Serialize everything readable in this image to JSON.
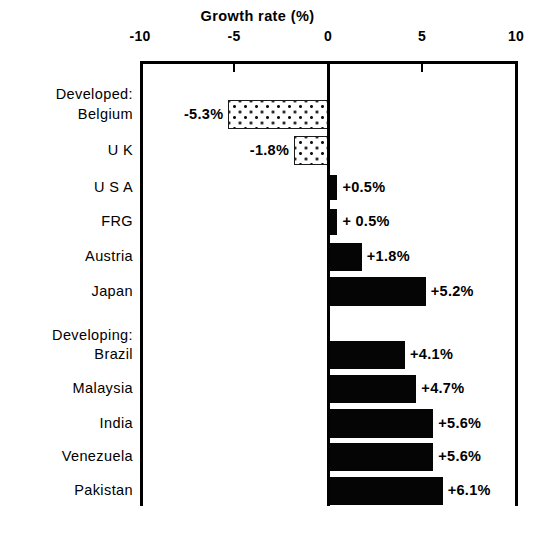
{
  "chart_data": {
    "type": "bar",
    "orientation": "horizontal",
    "title": "Growth rate (%)",
    "xlabel": "Growth rate (%)",
    "ylabel": "",
    "xlim": [
      -10,
      10
    ],
    "xticks": [
      -10,
      -5,
      0,
      5,
      10
    ],
    "xtick_labels": [
      "-10",
      "-5",
      "0",
      "5",
      "10"
    ],
    "grid": false,
    "legend": null,
    "zero_line": 0,
    "groups": [
      {
        "label": "Developed:",
        "key": "developed"
      },
      {
        "label": "Developing:",
        "key": "developing"
      }
    ],
    "categories": [
      "Belgium",
      "U K",
      "U S A",
      "FRG",
      "Austria",
      "Japan",
      "Brazil",
      "Malaysia",
      "India",
      "Venezuela",
      "Pakistan"
    ],
    "values": [
      -5.3,
      -1.8,
      0.5,
      0.5,
      1.8,
      5.2,
      4.1,
      4.7,
      5.6,
      5.6,
      6.1
    ],
    "data_labels": [
      "-5.3%",
      "-1.8%",
      "+0.5%",
      "+ 0.5%",
      "+1.8%",
      "+5.2%",
      "+4.1%",
      "+4.7%",
      "+5.6%",
      "+5.6%",
      "+6.1%"
    ],
    "series": [
      {
        "name": "Growth rate",
        "points": [
          {
            "group": "Developed:",
            "category": "Belgium",
            "value": -5.3,
            "label": "-5.3%",
            "fill": "dotted"
          },
          {
            "group": "Developed:",
            "category": "U K",
            "value": -1.8,
            "label": "-1.8%",
            "fill": "dotted"
          },
          {
            "group": "Developed:",
            "category": "U S A",
            "value": 0.5,
            "label": "+0.5%",
            "fill": "solid"
          },
          {
            "group": "Developed:",
            "category": "FRG",
            "value": 0.5,
            "label": "+ 0.5%",
            "fill": "solid"
          },
          {
            "group": "Developed:",
            "category": "Austria",
            "value": 1.8,
            "label": "+1.8%",
            "fill": "solid"
          },
          {
            "group": "Developed:",
            "category": "Japan",
            "value": 5.2,
            "label": "+5.2%",
            "fill": "solid"
          },
          {
            "group": "Developing:",
            "category": "Brazil",
            "value": 4.1,
            "label": "+4.1%",
            "fill": "solid"
          },
          {
            "group": "Developing:",
            "category": "Malaysia",
            "value": 4.7,
            "label": "+4.7%",
            "fill": "solid"
          },
          {
            "group": "Developing:",
            "category": "India",
            "value": 5.6,
            "label": "+5.6%",
            "fill": "solid"
          },
          {
            "group": "Developing:",
            "category": "Venezuela",
            "value": 5.6,
            "label": "+5.6%",
            "fill": "solid"
          },
          {
            "group": "Developing:",
            "category": "Pakistan",
            "value": 6.1,
            "label": "+6.1%",
            "fill": "solid"
          }
        ]
      }
    ],
    "colors": {
      "bar_positive": "#050505",
      "bar_negative_edge": "#1a1a1a",
      "bar_negative_fill": "#ffffff",
      "axis": "#000000",
      "text": "#000000",
      "background": "#ffffff"
    }
  },
  "title": {
    "text": "Growth rate (%)"
  },
  "axis": {
    "ticks": [
      {
        "value": -10,
        "label": "-10",
        "x": 140
      },
      {
        "value": -5,
        "label": "-5",
        "x": 234
      },
      {
        "value": 0,
        "label": "0",
        "x": 328
      },
      {
        "value": 5,
        "label": "5",
        "x": 422
      },
      {
        "value": 10,
        "label": "10",
        "x": 516
      }
    ]
  },
  "rows": [
    {
      "kind": "group",
      "label": "Developed:",
      "y": 86
    },
    {
      "kind": "bar",
      "label": "Belgium",
      "value": -5.3,
      "data_label": "-5.3%",
      "fill": "dotted",
      "y": 100,
      "h": 29
    },
    {
      "kind": "bar",
      "label": "U K",
      "value": -1.8,
      "data_label": "-1.8%",
      "fill": "dotted",
      "y": 136,
      "h": 29
    },
    {
      "kind": "bar",
      "label": "U S A",
      "value": 0.5,
      "data_label": "+0.5%",
      "fill": "solid",
      "y": 175,
      "h": 25
    },
    {
      "kind": "bar",
      "label": "FRG",
      "value": 0.5,
      "data_label": "+ 0.5%",
      "fill": "solid",
      "y": 209,
      "h": 26
    },
    {
      "kind": "bar",
      "label": "Austria",
      "value": 1.8,
      "data_label": "+1.8%",
      "fill": "solid",
      "y": 243,
      "h": 28
    },
    {
      "kind": "bar",
      "label": "Japan",
      "value": 5.2,
      "data_label": "+5.2%",
      "fill": "solid",
      "y": 277,
      "h": 29
    },
    {
      "kind": "group",
      "label": "Developing:",
      "y": 327
    },
    {
      "kind": "bar",
      "label": "Brazil",
      "value": 4.1,
      "data_label": "+4.1%",
      "fill": "solid",
      "y": 341,
      "h": 28
    },
    {
      "kind": "bar",
      "label": "Malaysia",
      "value": 4.7,
      "data_label": "+4.7%",
      "fill": "solid",
      "y": 375,
      "h": 28
    },
    {
      "kind": "bar",
      "label": "India",
      "value": 5.6,
      "data_label": "+5.6%",
      "fill": "solid",
      "y": 409,
      "h": 29
    },
    {
      "kind": "bar",
      "label": "Venezuela",
      "value": 5.6,
      "data_label": "+5.6%",
      "fill": "solid",
      "y": 443,
      "h": 28
    },
    {
      "kind": "bar",
      "label": "Pakistan",
      "value": 6.1,
      "data_label": "+6.1%",
      "fill": "solid",
      "y": 477,
      "h": 28
    }
  ]
}
